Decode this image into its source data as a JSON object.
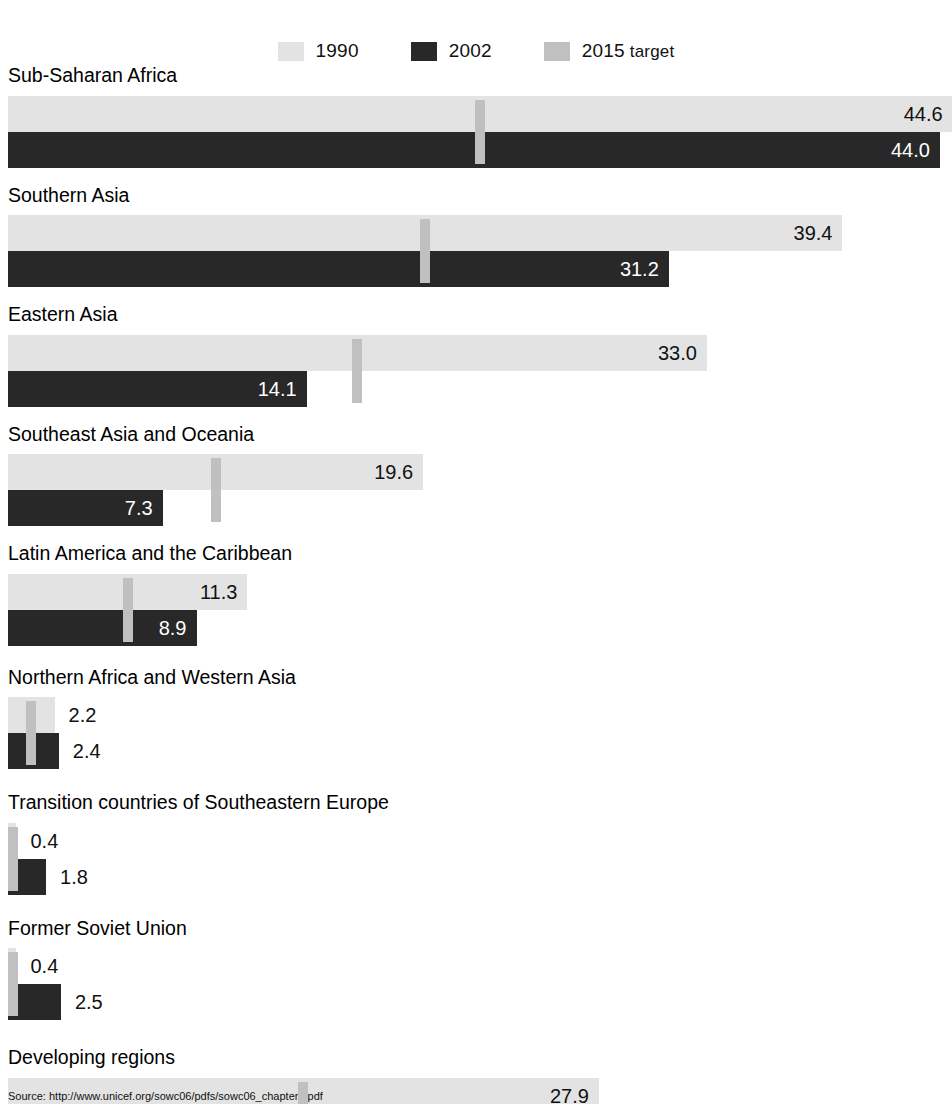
{
  "legend": {
    "items": [
      {
        "label": "1990",
        "sub": "",
        "color": "#e3e3e3",
        "name": "legend-swatch-1990"
      },
      {
        "label": "2002",
        "sub": "",
        "color": "#282828",
        "name": "legend-swatch-2002"
      },
      {
        "label": "2015",
        "sub": " target",
        "color": "#c0c0c0",
        "name": "legend-swatch-2015-target"
      }
    ]
  },
  "source": {
    "text": "Source: http://www.unicef.org/sowc06/pdfs/sowc06_chapter1.pdf"
  },
  "chart_data": {
    "type": "bar",
    "orientation": "horizontal",
    "title": "",
    "xlabel": "",
    "ylabel": "",
    "xlim": [
      0,
      44.6
    ],
    "grid": false,
    "legend_position": "top-center",
    "categories": [
      "Sub-Saharan Africa",
      "Southern Asia",
      "Eastern Asia",
      "Southeast Asia and Oceania",
      "Latin America and the Caribbean",
      "Northern Africa and Western Asia",
      "Transition countries of Southeastern Europe",
      "Former Soviet Union",
      "Developing regions"
    ],
    "series": [
      {
        "name": "1990",
        "values": [
          44.6,
          39.4,
          33.0,
          19.6,
          11.3,
          2.2,
          0.4,
          0.4,
          27.9
        ]
      },
      {
        "name": "2002",
        "values": [
          44.0,
          31.2,
          14.1,
          7.3,
          8.9,
          2.4,
          1.8,
          2.5,
          19.4
        ]
      },
      {
        "name": "2015 target",
        "values": [
          22.3,
          19.7,
          16.5,
          9.8,
          5.65,
          1.1,
          0.2,
          0.2,
          13.95
        ]
      }
    ],
    "value_labels": {
      "1990": [
        "44.6",
        "39.4",
        "33.0",
        "19.6",
        "11.3",
        "2.2",
        "0.4",
        "0.4",
        "27.9"
      ],
      "2002": [
        "44.0",
        "31.2",
        "14.1",
        "7.3",
        "8.9",
        "2.4",
        "1.8",
        "2.5",
        "19.4"
      ]
    }
  }
}
